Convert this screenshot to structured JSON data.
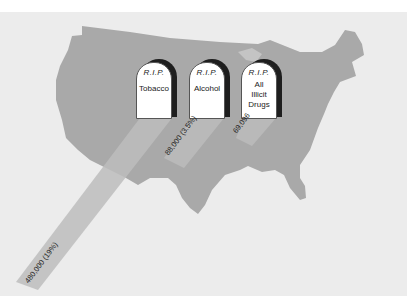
{
  "figure": {
    "background_color": "#ececec",
    "map_color": "#a9a9a9",
    "beam_color": "#bdbdbd"
  },
  "tombstones": [
    {
      "rip": "R.I.P.",
      "cause": "Tobacco",
      "deaths": "480,000 (19%)"
    },
    {
      "rip": "R.I.P.",
      "cause": "Alcohol",
      "deaths": "88,000 (3.5%)"
    },
    {
      "rip": "R.I.P.",
      "cause_lines": [
        "All",
        "Illicit",
        "Drugs"
      ],
      "deaths": "69,096"
    }
  ]
}
